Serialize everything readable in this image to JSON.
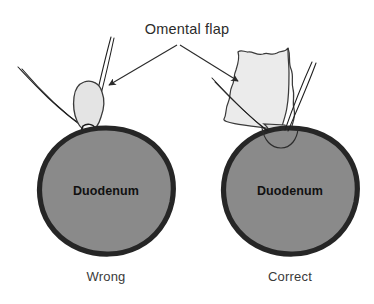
{
  "figure": {
    "title": "Omental flap",
    "width": 374,
    "height": 304,
    "background_color": "#ffffff"
  },
  "colors": {
    "duodenum_fill": "#8a8a8a",
    "duodenum_outline": "#262626",
    "omentum_fill": "#e4e4e4",
    "omentum_outline": "#3a3a3a",
    "suture_line": "#1f1f1f",
    "leader_line": "#2b2b2b",
    "title_text": "#2b2b2b",
    "caption_text": "#3a3a3a",
    "organ_text": "#111111"
  },
  "panels": [
    {
      "id": "wrong",
      "caption": "Wrong",
      "organ_label": "Duodenum",
      "omentum_label": "omental-plug",
      "description": "small omental plug tied into perforation"
    },
    {
      "id": "correct",
      "caption": "Correct",
      "organ_label": "Duodenum",
      "omentum_label": "omental-flap",
      "description": "broad omental flap laid over perforation"
    }
  ],
  "annotations": {
    "leader_left_target": "omental-plug",
    "leader_right_target": "omental-flap",
    "arrowhead_count": 2
  }
}
